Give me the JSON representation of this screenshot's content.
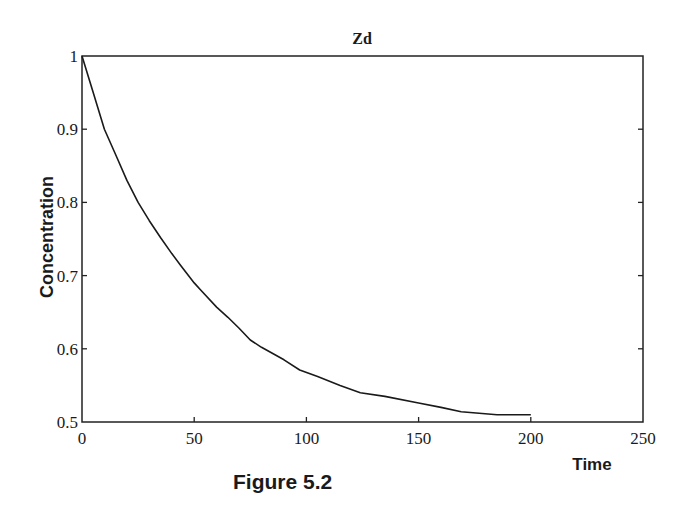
{
  "chart_data": {
    "type": "line",
    "title": "Zd",
    "xlabel": "Time",
    "ylabel": "Concentration",
    "xlim": [
      0,
      250
    ],
    "ylim": [
      0.5,
      1
    ],
    "xticks": [
      0,
      50,
      100,
      150,
      200,
      250
    ],
    "xtick_labels": [
      "0",
      "50",
      "100",
      "150",
      "200",
      "250"
    ],
    "yticks": [
      0.5,
      0.6,
      0.7,
      0.8,
      0.9,
      1
    ],
    "ytick_labels": [
      "0.5",
      "0.6",
      "0.7",
      "0.8",
      "0.9",
      "1"
    ],
    "grid": false,
    "legend": null,
    "series": [
      {
        "name": "Zd",
        "color": "#1a1a1a",
        "x": [
          0,
          5,
          10,
          15,
          20,
          25,
          30,
          35,
          40,
          44,
          50,
          53,
          60,
          65,
          70,
          75,
          80,
          90,
          97,
          105,
          115,
          124,
          135,
          150,
          160,
          169,
          185,
          200
        ],
        "y": [
          1.0,
          0.95,
          0.9,
          0.865,
          0.83,
          0.8,
          0.775,
          0.752,
          0.73,
          0.714,
          0.69,
          0.68,
          0.657,
          0.643,
          0.628,
          0.612,
          0.602,
          0.585,
          0.571,
          0.562,
          0.55,
          0.54,
          0.535,
          0.526,
          0.52,
          0.514,
          0.51,
          0.51
        ]
      }
    ]
  },
  "caption": "Figure 5.2"
}
